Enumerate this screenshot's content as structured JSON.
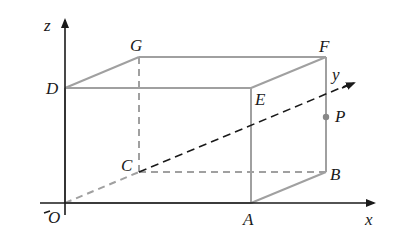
{
  "diagram": {
    "type": "3d-coordinate-box",
    "axes": {
      "x": "x",
      "y": "y",
      "z": "z",
      "origin": "O"
    },
    "vertices": {
      "O": "O",
      "A": "A",
      "B": "B",
      "C": "C",
      "D": "D",
      "E": "E",
      "F": "F",
      "G": "G"
    },
    "points": {
      "P": "P"
    },
    "colors": {
      "edge": "#a0a0a0",
      "axis": "#1a1a1a",
      "label": "#1a1a1a"
    }
  }
}
